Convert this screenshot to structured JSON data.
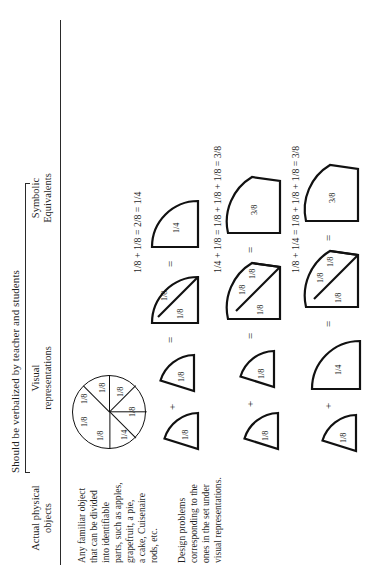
{
  "document": {
    "orientation": "rotated-90-ccw",
    "spanning_header": "Should be verbalized by teacher and students",
    "columns": [
      {
        "id": "actual",
        "head_line1": "Actual physical",
        "head_line2": "objects"
      },
      {
        "id": "visual",
        "head_line1": "Visual",
        "head_line2": "representations"
      },
      {
        "id": "symbolic",
        "head_line1": "Symbolic",
        "head_line2": "Equivalents"
      }
    ]
  },
  "actual_objects": {
    "paragraph1": [
      "Any familiar object",
      "that can be divided",
      "into identifiable",
      "parts, such as apples,",
      "grapefruit, a pie,",
      "a cake, Cuisenaire",
      "rods, etc."
    ],
    "paragraph2": [
      "Design problems",
      "corresponding to the",
      "ones in the set under",
      "visual representations."
    ]
  },
  "symbolic": {
    "equations": [
      "",
      "1/8 + 1/8 = 2/8 = 1/4",
      "1/4 + 1/8 = 1/8 + 1/8 + 1/8 = 3/8",
      "1/8 + 1/4 = 1/8 + 1/8 + 1/8 = 3/8"
    ]
  },
  "visual": {
    "row1": {
      "name": "whole-circle-partitioned",
      "sector_labels": [
        "1/8",
        "1/8",
        "1/8",
        "1/8",
        "1/8",
        "1/8",
        "1/4"
      ]
    },
    "row2": {
      "addends": [
        "1/8",
        "1/8"
      ],
      "combined_labels": [
        "1/8",
        "1/8"
      ],
      "result_label": "1/4",
      "plus": "+",
      "equals": "="
    },
    "row3": {
      "addends": [
        "1/8",
        "1/8"
      ],
      "combined_labels": [
        "1/8",
        "1/8",
        "1/8"
      ],
      "result_label": "3/8",
      "plus": "+",
      "equals": "="
    },
    "row4": {
      "addends": [
        "1/8",
        "1/4"
      ],
      "combined_labels": [
        "1/8",
        "1/8",
        "1/8"
      ],
      "result_label": "3/8",
      "plus": "+",
      "equals": "="
    }
  }
}
